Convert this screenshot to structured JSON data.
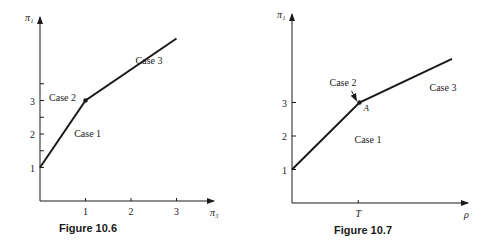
{
  "chart_data": [
    {
      "type": "line",
      "caption": "Figure 10.6",
      "xlabel": "π₃",
      "ylabel": "π₁",
      "xlim": [
        0,
        3.3
      ],
      "ylim": [
        0,
        5.7
      ],
      "x_ticks": [
        1,
        2,
        3
      ],
      "x_tick_labels": [
        "1",
        "2",
        "3"
      ],
      "y_ticks": [
        1,
        2,
        3
      ],
      "y_tick_labels": [
        "1",
        "2",
        "3"
      ],
      "y_minor_ticks": [
        1.5,
        2.5,
        3.5
      ],
      "grid": false,
      "series": [
        {
          "name": "piecewise",
          "x": [
            0,
            1,
            3
          ],
          "y": [
            1,
            3,
            4.85
          ]
        }
      ],
      "points": [
        {
          "x": 1,
          "y": 3
        }
      ],
      "annotations": [
        {
          "text": "Case 1",
          "x": 0.75,
          "y": 1.9
        },
        {
          "text": "Case 2",
          "x": 0.2,
          "y": 3
        },
        {
          "text": "Case 3",
          "x": 2.1,
          "y": 4.1
        }
      ]
    },
    {
      "type": "line",
      "caption": "Figure 10.7",
      "xlabel": "ρ",
      "ylabel": "π₁",
      "xlim": [
        0,
        1.55
      ],
      "ylim": [
        0,
        5.7
      ],
      "x_ticks": [
        0.53
      ],
      "x_tick_labels": [
        "T"
      ],
      "y_ticks": [
        1,
        2,
        3
      ],
      "y_tick_labels": [
        "1",
        "2",
        "3"
      ],
      "grid": false,
      "series": [
        {
          "name": "piecewise",
          "x": [
            0,
            0.54,
            1.28
          ],
          "y": [
            1,
            3,
            4.3
          ]
        }
      ],
      "points": [
        {
          "x": 0.54,
          "y": 3,
          "label": "A"
        }
      ],
      "annotations": [
        {
          "text": "Case 1",
          "x": 0.5,
          "y": 1.8
        },
        {
          "text": "Case 2",
          "x": 0.3,
          "y": 3.5,
          "arrow_to": [
            0.54,
            3
          ]
        },
        {
          "text": "Case 3",
          "x": 1.1,
          "y": 3.35
        }
      ]
    }
  ]
}
